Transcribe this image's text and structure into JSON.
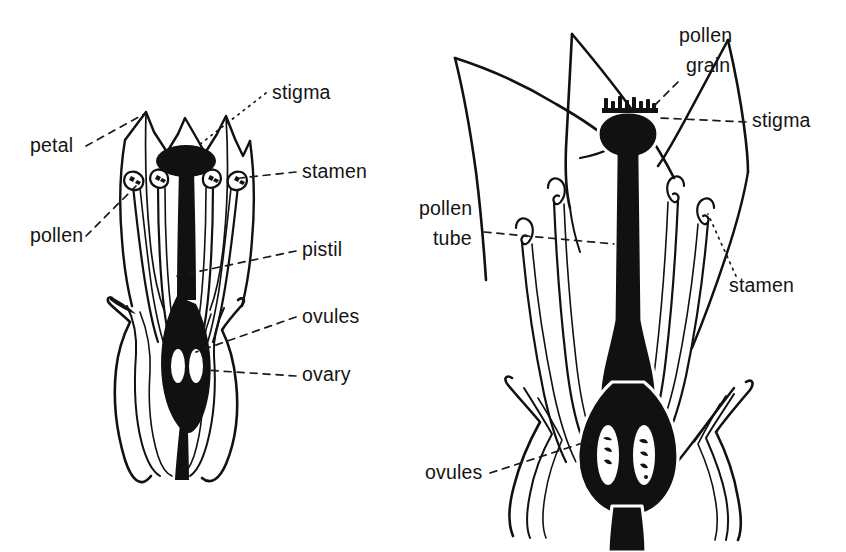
{
  "figure": {
    "kind": "botanical-line-diagram",
    "background_color": "#ffffff",
    "ink_color": "#111111",
    "panels": [
      {
        "id": "left",
        "name": "flower-before-pollination",
        "labels": [
          {
            "key": "petal",
            "text": "petal",
            "x": 30,
            "y": 152,
            "anchor": "start",
            "leader": "dash"
          },
          {
            "key": "pollen",
            "text": "pollen",
            "x": 30,
            "y": 242,
            "anchor": "start",
            "leader": "dash"
          },
          {
            "key": "stigma",
            "text": "stigma",
            "x": 272,
            "y": 99,
            "anchor": "start",
            "leader": "dot"
          },
          {
            "key": "stamen",
            "text": "stamen",
            "x": 302,
            "y": 178,
            "anchor": "start",
            "leader": "dash"
          },
          {
            "key": "pistil",
            "text": "pistil",
            "x": 302,
            "y": 256,
            "anchor": "start",
            "leader": "dash"
          },
          {
            "key": "ovules",
            "text": "ovules",
            "x": 302,
            "y": 323,
            "anchor": "start",
            "leader": "dash"
          },
          {
            "key": "ovary",
            "text": "ovary",
            "x": 302,
            "y": 381,
            "anchor": "start",
            "leader": "dash"
          }
        ],
        "parts": {
          "petal_count": 4,
          "stamen_count": 4,
          "ovule_count": 2,
          "ovary_fill": "solid-black",
          "ovule_fill": "white"
        }
      },
      {
        "id": "right",
        "name": "flower-after-pollination",
        "labels": [
          {
            "key": "pollen_grain_1",
            "text": "pollen",
            "x": 679,
            "y": 42,
            "anchor": "start",
            "leader": "none"
          },
          {
            "key": "pollen_grain_2",
            "text": "grain",
            "x": 686,
            "y": 72,
            "anchor": "start",
            "leader": "dash"
          },
          {
            "key": "stigma",
            "text": "stigma",
            "x": 752,
            "y": 127,
            "anchor": "start",
            "leader": "dash"
          },
          {
            "key": "pollen_tube_1",
            "text": "pollen",
            "x": 419,
            "y": 215,
            "anchor": "start",
            "leader": "none"
          },
          {
            "key": "pollen_tube_2",
            "text": "tube",
            "x": 433,
            "y": 245,
            "anchor": "start",
            "leader": "dash"
          },
          {
            "key": "stamen",
            "text": "stamen",
            "x": 729,
            "y": 292,
            "anchor": "start",
            "leader": "dot"
          },
          {
            "key": "ovules",
            "text": "ovules",
            "x": 425,
            "y": 479,
            "anchor": "start",
            "leader": "dash"
          }
        ],
        "parts": {
          "petal_count": 4,
          "stamen_count": 4,
          "ovule_count": 2,
          "pollen_grains_on_stigma": 8,
          "ovary_fill": "solid-black",
          "ovule_fill": "white",
          "ovule_contains_embryo": true
        }
      }
    ],
    "all_label_terms": [
      "petal",
      "pollen",
      "stigma",
      "stamen",
      "pistil",
      "ovules",
      "ovary",
      "pollen grain",
      "pollen tube"
    ]
  }
}
